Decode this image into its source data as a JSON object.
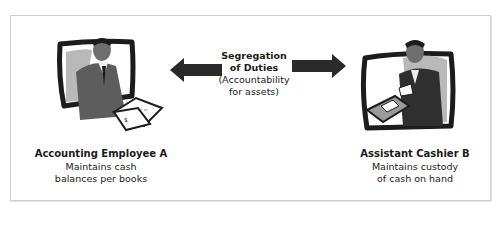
{
  "diagram": {
    "center": {
      "title_line1": "Segregation",
      "title_line2": "of Duties",
      "subtitle_line1": "(Accountability",
      "subtitle_line2": "for assets)"
    },
    "left": {
      "title": "Accounting Employee A",
      "desc_line1": "Maintains cash",
      "desc_line2": "balances per books",
      "icon": "employee-reading-ledger-illustration"
    },
    "right": {
      "title": "Assistant Cashier B",
      "desc_line1": "Maintains custody",
      "desc_line2": "of cash on hand",
      "icon": "cashier-handling-cash-illustration"
    },
    "arrows": [
      "left-arrow",
      "right-arrow"
    ],
    "colors": {
      "arrow": "#2a2a2a",
      "frame_border": "#cfcfcf",
      "illustration_dark": "#1c1c1c",
      "illustration_mid": "#6e6e6e",
      "illustration_light": "#b9b9b9"
    }
  }
}
